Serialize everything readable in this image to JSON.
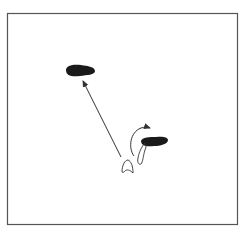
{
  "diagram": {
    "type": "footwork-step-diagram",
    "frame": {
      "x": 7,
      "y": 13,
      "width": 231,
      "height": 212,
      "stroke": "#555555"
    },
    "elements": [
      {
        "name": "left-foot-target",
        "kind": "filled-footprint",
        "cx": 80,
        "cy": 71,
        "color": "#1a1a1a"
      },
      {
        "name": "right-foot-planted",
        "kind": "filled-footprint",
        "cx": 153,
        "cy": 141,
        "color": "#1a1a1a"
      },
      {
        "name": "long-step-arrow",
        "kind": "arrow",
        "from": [
          122,
          157
        ],
        "to": [
          82,
          80
        ],
        "color": "#333333"
      },
      {
        "name": "pivot-arrow",
        "kind": "curved-arrow",
        "from": [
          134,
          156
        ],
        "to": [
          151,
          128
        ],
        "color": "#333333"
      },
      {
        "name": "foot-outline-start",
        "kind": "outline-footprint",
        "cx": 127,
        "cy": 166
      },
      {
        "name": "foot-outline-trail",
        "kind": "outline-footprint",
        "cx": 142,
        "cy": 150
      }
    ]
  }
}
